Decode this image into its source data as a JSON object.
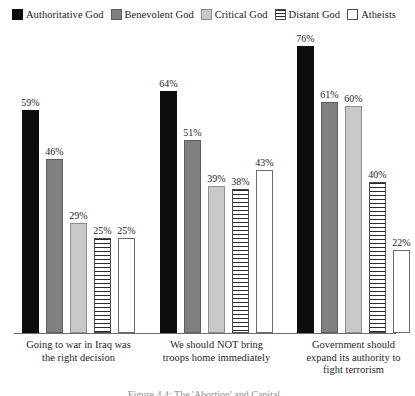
{
  "legend": {
    "items": [
      {
        "label": "Authoritative God",
        "swatch": "solid-black-swatch",
        "color": "#0d0d0d"
      },
      {
        "label": "Benevolent God",
        "swatch": "solid-gray-swatch",
        "color": "#808080"
      },
      {
        "label": "Critical God",
        "swatch": "light-gray-swatch",
        "color": "#c8c8c8"
      },
      {
        "label": "Distant God",
        "swatch": "striped-swatch",
        "color": "#ffffff"
      },
      {
        "label": "Atheists",
        "swatch": "empty-swatch",
        "color": "#ffffff"
      }
    ]
  },
  "caption": {
    "text": "Figure 4.4: The 'Abortion' and Capital"
  },
  "chart_data": {
    "type": "bar",
    "title": "",
    "xlabel": "",
    "ylabel": "",
    "ylim": [
      0,
      80
    ],
    "grid": false,
    "legend_position": "top",
    "value_suffix": "%",
    "categories": [
      "Going to war in Iraq was the right decision",
      "We should NOT bring troops home immediately",
      "Government should expand its authority to fight terrorism"
    ],
    "category_lines": [
      [
        "Going to war in Iraq was",
        "the right decision"
      ],
      [
        "We should NOT bring",
        "troops home immediately"
      ],
      [
        "Government should",
        "expand its authority to",
        "fight terrorism"
      ]
    ],
    "series": [
      {
        "name": "Authoritative God",
        "values": [
          59,
          64,
          76
        ],
        "labels": [
          "59%",
          "64%",
          "76%"
        ]
      },
      {
        "name": "Benevolent God",
        "values": [
          46,
          51,
          61
        ],
        "labels": [
          "46%",
          "51%",
          "61%"
        ]
      },
      {
        "name": "Critical God",
        "values": [
          29,
          39,
          60
        ],
        "labels": [
          "29%",
          "39%",
          "60%"
        ]
      },
      {
        "name": "Distant God",
        "values": [
          25,
          38,
          40
        ],
        "labels": [
          "25%",
          "38%",
          "40%"
        ]
      },
      {
        "name": "Atheists",
        "values": [
          25,
          43,
          22
        ],
        "labels": [
          "25%",
          "43%",
          "22%"
        ]
      }
    ]
  }
}
